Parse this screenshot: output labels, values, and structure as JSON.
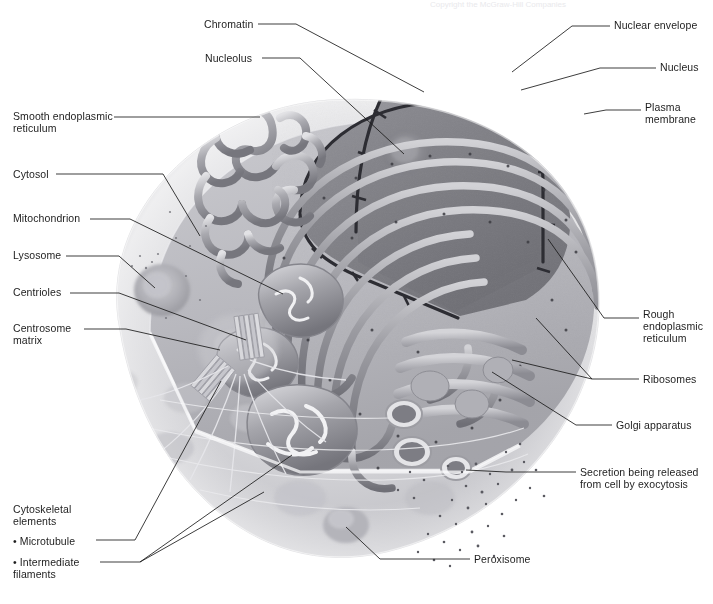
{
  "figure": {
    "top_faint_text": "Copyright  the McGraw-Hill Companies"
  },
  "palette": {
    "ink": "#1a1a1a",
    "leader_line": "#1a1a1a",
    "cytoplasm_light": "#d6d6d8",
    "cytoplasm_mid": "#b9b9bd",
    "membrane_edge": "#f2f2f3",
    "nucleus_fill": "#8e8e93",
    "nucleolus": "#6f6f75",
    "er_mid": "#9a9aa0",
    "er_dark": "#6a6a70",
    "golgi": "#a8a8ad",
    "background": "#ffffff"
  },
  "labels_left": [
    {
      "id": "chromatin",
      "text": "Chromatin",
      "x": 204,
      "y": 18
    },
    {
      "id": "nucleolus",
      "text": "Nucleolus",
      "x": 205,
      "y": 52
    },
    {
      "id": "smooth-er",
      "text": "Smooth endoplasmic\nreticulum",
      "x": 13,
      "y": 110
    },
    {
      "id": "cytosol",
      "text": "Cytosol",
      "x": 13,
      "y": 168
    },
    {
      "id": "mitochondrion",
      "text": "Mitochondrion",
      "x": 13,
      "y": 212
    },
    {
      "id": "lysosome",
      "text": "Lysosome",
      "x": 13,
      "y": 249
    },
    {
      "id": "centrioles",
      "text": "Centrioles",
      "x": 13,
      "y": 286
    },
    {
      "id": "centrosome",
      "text": "Centrosome\nmatrix",
      "x": 13,
      "y": 322
    },
    {
      "id": "cytoskeletal",
      "text": "Cytoskeletal\nelements",
      "x": 13,
      "y": 503
    },
    {
      "id": "microtubule",
      "text": "• Microtubule",
      "x": 13,
      "y": 535
    },
    {
      "id": "intermediate-filaments",
      "text": "• Intermediate\n   filaments",
      "x": 13,
      "y": 556
    }
  ],
  "labels_right": [
    {
      "id": "nuclear-envelope",
      "text": "Nuclear envelope",
      "x": 614,
      "y": 19
    },
    {
      "id": "nucleus",
      "text": "Nucleus",
      "x": 660,
      "y": 61
    },
    {
      "id": "plasma-membrane",
      "text": "Plasma\nmembrane",
      "x": 645,
      "y": 101
    },
    {
      "id": "rough-er",
      "text": "Rough\nendoplasmic\nreticulum",
      "x": 643,
      "y": 308
    },
    {
      "id": "ribosomes",
      "text": "Ribosomes",
      "x": 643,
      "y": 373
    },
    {
      "id": "golgi-apparatus",
      "text": "Golgi apparatus",
      "x": 616,
      "y": 419
    },
    {
      "id": "secretion",
      "text": "Secretion being released\nfrom cell by exocytosis",
      "x": 580,
      "y": 466
    },
    {
      "id": "peroxisome",
      "text": "Peroxisome",
      "x": 474,
      "y": 553
    }
  ],
  "leader_lines": [
    {
      "id": "chromatin-leader",
      "points": "258,24 296,24 424,92"
    },
    {
      "id": "nucleolus-leader",
      "points": "262,58 300,58 404,154"
    },
    {
      "id": "smooth-er-leader",
      "points": "114,117 260,117"
    },
    {
      "id": "cytosol-leader",
      "points": "56,174 163,174 200,236"
    },
    {
      "id": "mitochondrion-leader",
      "points": "90,219 130,219 283,294"
    },
    {
      "id": "lysosome-leader",
      "points": "66,256 119,256 155,288"
    },
    {
      "id": "centrioles-leader",
      "points": "70,293 119,293 246,340"
    },
    {
      "id": "centrosome-leader",
      "points": "84,329 126,329 220,350"
    },
    {
      "id": "microtubule-leader",
      "points": "96,540 135,540 221,381"
    },
    {
      "id": "if-leader-a",
      "points": "100,562 140,562 292,455"
    },
    {
      "id": "if-leader-b",
      "points": "140,562 264,492"
    },
    {
      "id": "nuclear-env-leader",
      "points": "610,26 572,26 512,72"
    },
    {
      "id": "nucleus-leader",
      "points": "656,68 600,68 521,90"
    },
    {
      "id": "plasma-mem-leader",
      "points": "641,110 606,110 584,114"
    },
    {
      "id": "rough-er-leader",
      "points": "639,318 604,318 548,239"
    },
    {
      "id": "ribosomes-leader",
      "points": "639,379 592,379 512,360"
    },
    {
      "id": "ribosomes-leader2",
      "points": "592,379 536,318"
    },
    {
      "id": "golgi-leader",
      "points": "612,425 576,425 492,372"
    },
    {
      "id": "secretion-leader",
      "points": "576,472 506,472 466,470"
    },
    {
      "id": "peroxisome-leader",
      "points": "470,559 380,559 346,527"
    }
  ],
  "organelles": [
    {
      "id": "nucleus",
      "name": "Nucleus"
    },
    {
      "id": "nucleolus",
      "name": "Nucleolus"
    },
    {
      "id": "chromatin",
      "name": "Chromatin"
    },
    {
      "id": "nuclear-envelope",
      "name": "Nuclear envelope"
    },
    {
      "id": "rough-er",
      "name": "Rough endoplasmic reticulum"
    },
    {
      "id": "smooth-er",
      "name": "Smooth endoplasmic reticulum"
    },
    {
      "id": "ribosomes",
      "name": "Ribosomes"
    },
    {
      "id": "golgi-apparatus",
      "name": "Golgi apparatus"
    },
    {
      "id": "mitochondrion",
      "name": "Mitochondrion"
    },
    {
      "id": "lysosome",
      "name": "Lysosome"
    },
    {
      "id": "peroxisome",
      "name": "Peroxisome"
    },
    {
      "id": "centrioles",
      "name": "Centrioles"
    },
    {
      "id": "centrosome-matrix",
      "name": "Centrosome matrix"
    },
    {
      "id": "plasma-membrane",
      "name": "Plasma membrane"
    },
    {
      "id": "cytosol",
      "name": "Cytosol"
    },
    {
      "id": "microtubule",
      "name": "Microtubule"
    },
    {
      "id": "intermediate-filaments",
      "name": "Intermediate filaments"
    },
    {
      "id": "secretory-vesicle",
      "name": "Secretion vesicle"
    }
  ]
}
